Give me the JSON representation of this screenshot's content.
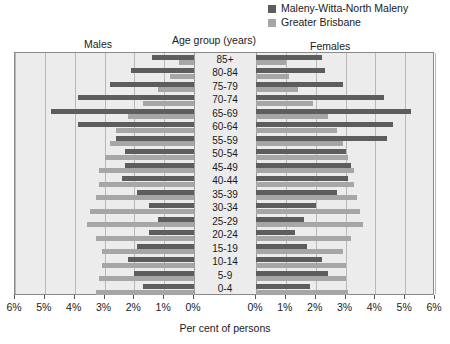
{
  "legend": {
    "items": [
      {
        "label": "Maleny-Witta-North Maleny",
        "color": "#5d5d5d",
        "key": "primary"
      },
      {
        "label": "Greater Brisbane",
        "color": "#a6a6a6",
        "key": "secondary"
      }
    ]
  },
  "headings": {
    "males": "Males",
    "females": "Females",
    "age_group": "Age group (years)"
  },
  "chart_data": {
    "type": "bar",
    "subtype": "population-pyramid",
    "title": "",
    "xlabel": "Per cent of persons",
    "ylabel": "Age group (years)",
    "left_panel_label": "Males",
    "right_panel_label": "Females",
    "categories": [
      "85+",
      "80-84",
      "75-79",
      "70-74",
      "65-69",
      "60-64",
      "55-59",
      "50-54",
      "45-49",
      "40-44",
      "35-39",
      "30-34",
      "25-29",
      "20-24",
      "15-19",
      "10-14",
      "5-9",
      "0-4"
    ],
    "xlim": [
      0,
      6
    ],
    "xticks": [
      6,
      5,
      4,
      3,
      2,
      1,
      0
    ],
    "xticks_right": [
      0,
      1,
      2,
      3,
      4,
      5,
      6
    ],
    "xtick_labels": [
      "6%",
      "5%",
      "4%",
      "3%",
      "2%",
      "1%",
      "0%"
    ],
    "xtick_labels_right": [
      "0%",
      "1%",
      "2%",
      "3%",
      "4%",
      "5%",
      "6%"
    ],
    "grid": true,
    "legend_position": "top-right",
    "units": "per cent of persons",
    "series": [
      {
        "name": "Maleny-Witta-North Maleny",
        "color": "#5d5d5d",
        "males": [
          1.4,
          2.1,
          2.8,
          3.9,
          4.8,
          3.9,
          2.6,
          2.3,
          2.3,
          2.4,
          1.9,
          1.5,
          1.2,
          1.5,
          1.9,
          2.2,
          2.0,
          1.7
        ],
        "females": [
          2.2,
          2.3,
          2.9,
          4.3,
          5.2,
          4.6,
          4.4,
          3.0,
          3.2,
          3.1,
          2.7,
          2.0,
          1.6,
          1.3,
          1.7,
          2.2,
          2.4,
          1.8
        ]
      },
      {
        "name": "Greater Brisbane",
        "color": "#a6a6a6",
        "males": [
          0.5,
          0.8,
          1.2,
          1.7,
          2.2,
          2.6,
          2.8,
          3.0,
          3.2,
          3.2,
          3.3,
          3.5,
          3.6,
          3.3,
          3.1,
          3.1,
          3.2,
          3.3
        ],
        "females": [
          1.0,
          1.1,
          1.4,
          1.9,
          2.4,
          2.7,
          2.9,
          3.1,
          3.3,
          3.3,
          3.4,
          3.5,
          3.6,
          3.2,
          2.9,
          3.0,
          3.0,
          3.1
        ]
      }
    ]
  },
  "axis": {
    "x_title": "Per cent of persons"
  }
}
